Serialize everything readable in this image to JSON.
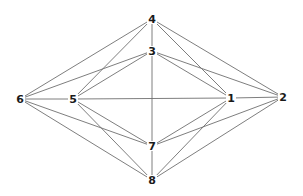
{
  "diagram": {
    "type": "graph",
    "nodes": [
      {
        "id": "1",
        "label": "1",
        "x": 231,
        "y": 98
      },
      {
        "id": "2",
        "label": "2",
        "x": 283,
        "y": 97
      },
      {
        "id": "3",
        "label": "3",
        "x": 152,
        "y": 51
      },
      {
        "id": "4",
        "label": "4",
        "x": 152,
        "y": 19
      },
      {
        "id": "5",
        "label": "5",
        "x": 73,
        "y": 99
      },
      {
        "id": "6",
        "label": "6",
        "x": 20,
        "y": 99
      },
      {
        "id": "7",
        "label": "7",
        "x": 152,
        "y": 146
      },
      {
        "id": "8",
        "label": "8",
        "x": 152,
        "y": 180
      }
    ],
    "edges": [
      [
        "6",
        "4"
      ],
      [
        "6",
        "3"
      ],
      [
        "6",
        "5"
      ],
      [
        "6",
        "7"
      ],
      [
        "6",
        "8"
      ],
      [
        "5",
        "4"
      ],
      [
        "5",
        "3"
      ],
      [
        "5",
        "1"
      ],
      [
        "5",
        "7"
      ],
      [
        "5",
        "8"
      ],
      [
        "4",
        "3"
      ],
      [
        "4",
        "1"
      ],
      [
        "4",
        "2"
      ],
      [
        "3",
        "1"
      ],
      [
        "3",
        "2"
      ],
      [
        "3",
        "7"
      ],
      [
        "1",
        "2"
      ],
      [
        "1",
        "7"
      ],
      [
        "1",
        "8"
      ],
      [
        "2",
        "7"
      ],
      [
        "2",
        "8"
      ],
      [
        "7",
        "8"
      ]
    ],
    "colors": {
      "edge": "#6f6f6f",
      "label": "#1a1a1a",
      "background": "#ffffff"
    }
  }
}
